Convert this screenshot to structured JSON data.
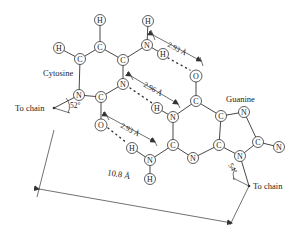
{
  "labels": {
    "cytosine": "Cytosine",
    "guanine": "Guanine",
    "to_chain_left": "To chain",
    "to_chain_right": "To chain"
  },
  "measurements": {
    "hbond_top": "2.93 Å",
    "hbond_middle": "2.96 Å",
    "hbond_bottom": "2.93 Å",
    "chain_distance": "10.8 Å",
    "angle_left": "52°",
    "angle_right": "54°"
  },
  "atoms": {
    "cytosine": {
      "h_top": "H",
      "c_top": "C",
      "h_left": "H",
      "c_left": "C",
      "c_right": "C",
      "n_amino": "N",
      "h_amino_top": "H",
      "h_amino_low": "H",
      "n1": "N",
      "n3": "N",
      "c2": "C",
      "o2": "O"
    },
    "guanine": {
      "o6": "O",
      "c6": "C",
      "n1": "N",
      "h1": "H",
      "c5": "C",
      "n7": "N",
      "c2": "C",
      "n_amino": "N",
      "h_amino_left": "H",
      "h_amino_low": "H",
      "n3": "N",
      "c4": "C",
      "c8": "C",
      "n_right": "N",
      "n9": "N"
    }
  },
  "colors": {
    "ink": "#333333",
    "background": "#ffffff"
  }
}
